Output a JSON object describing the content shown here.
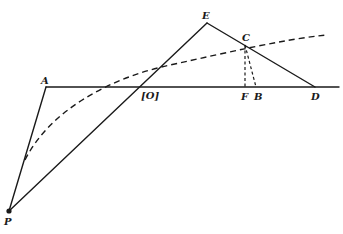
{
  "diagram": {
    "points": {
      "A": {
        "label": "A",
        "x": 46,
        "y": 87
      },
      "E": {
        "label": "E",
        "x": 207,
        "y": 23
      },
      "C": {
        "label": "C",
        "x": 245,
        "y": 45
      },
      "O": {
        "label": "[O]",
        "x": 138,
        "y": 87
      },
      "F": {
        "label": "F",
        "x": 245,
        "y": 87
      },
      "B": {
        "label": "B",
        "x": 256,
        "y": 87
      },
      "D": {
        "label": "D",
        "x": 315,
        "y": 87
      },
      "P": {
        "label": "P",
        "x": 9,
        "y": 211
      }
    },
    "colors": {
      "ink": "#1a1a1a",
      "background": "#ffffff"
    }
  }
}
